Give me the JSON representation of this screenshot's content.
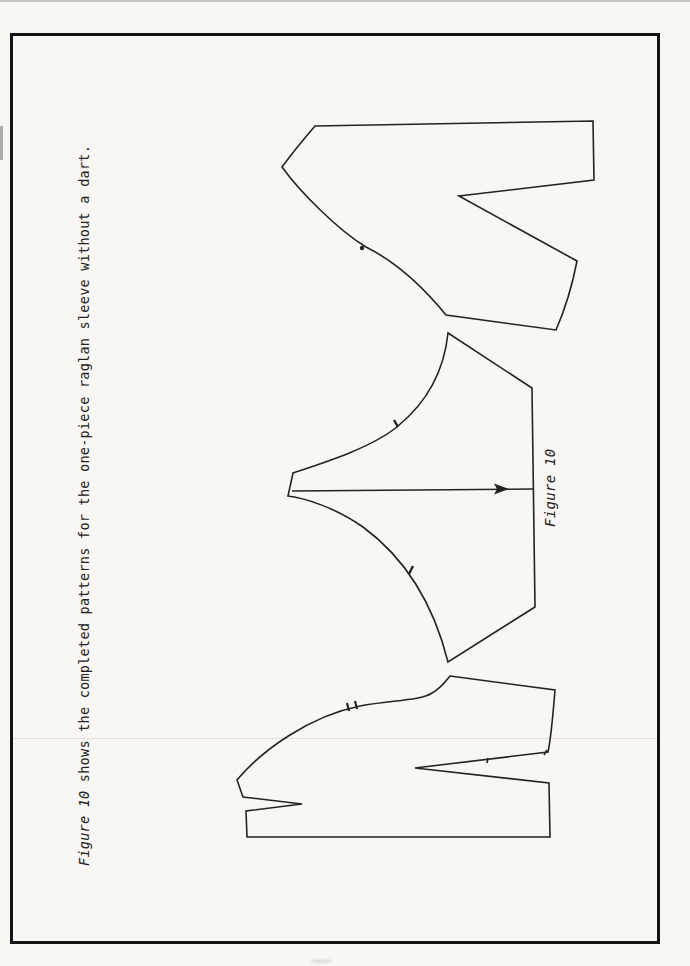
{
  "caption": {
    "figure_ref": "Figure 10",
    "text": " shows the completed patterns for the one-piece raglan sleeve without a dart."
  },
  "figure_label": "Figure 10",
  "colors": {
    "paper": "#f8f7f4",
    "ink": "#242322",
    "frame_border": "#151414"
  },
  "shapes": {
    "back_bodice": "M315,126 L593,121 L594,180 L459,196 L577,261 C571,292 563,314 556,330 L446,315 C424,288 398,263 366,247 C338,230 300,192 282,167 C293,152 303,140 315,126 Z",
    "sleeve": "M448,333 L532,388 L535,607 L448,662 C436,614 412,563 363,527 C336,508 305,498 288,496 L293,473 C320,464 372,448 398,426 C426,403 444,372 448,333 Z",
    "front_bodice": "M450,676 L555,690 C553,715 551,738 548,752 L415,768 L549,783 L550,837 L247,837 L246,811 L302,804 L243,797 L237,780 C262,750 310,716 360,706 C392,700 420,701 432,693 C436,691 443,685 450,676 Z",
    "grainline": "M292,491 L533,489"
  }
}
